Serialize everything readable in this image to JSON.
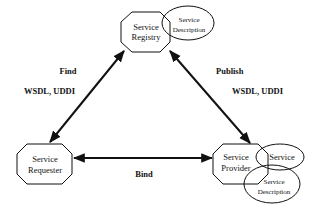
{
  "diagram": {
    "type": "service-oriented-architecture-triangle",
    "nodes": {
      "registry": {
        "line1": "Service",
        "line2": "Registry"
      },
      "requester": {
        "line1": "Service",
        "line2": "Requester"
      },
      "provider": {
        "line1": "Service",
        "line2": "Provider"
      }
    },
    "attachments": {
      "registry_description": {
        "line1": "Service",
        "line2": "Description"
      },
      "provider_service": {
        "label": "Service"
      },
      "provider_description": {
        "line1": "Service",
        "line2": "Description"
      }
    },
    "edges": {
      "find": {
        "label": "Find",
        "sublabel": "WSDL, UDDI",
        "from": "requester",
        "to": "registry"
      },
      "publish": {
        "label": "Publish",
        "sublabel": "WSDL, UDDI",
        "from": "provider",
        "to": "registry"
      },
      "bind": {
        "label": "Bind",
        "from": "requester",
        "to": "provider"
      }
    },
    "colors": {
      "stroke": "#111111",
      "background": "#ffffff"
    }
  }
}
